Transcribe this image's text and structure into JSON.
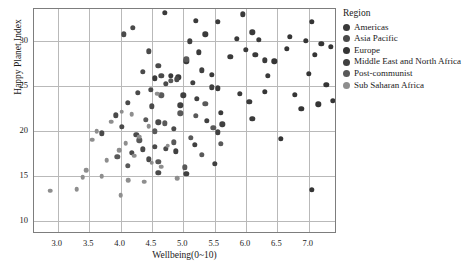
{
  "chart_data": {
    "type": "scatter",
    "title": "",
    "xlabel": "Wellbeing(0~10)",
    "ylabel": "Happy Planet Index",
    "xlim": [
      2.62,
      7.45
    ],
    "ylim": [
      8.6,
      33.6
    ],
    "xticks": [
      "3.0",
      "3.5",
      "4.0",
      "4.5",
      "5.0",
      "5.5",
      "6.0",
      "6.5",
      "7.0"
    ],
    "xtick_values": [
      3.0,
      3.5,
      4.0,
      4.5,
      5.0,
      5.5,
      6.0,
      6.5,
      7.0
    ],
    "yticks": [
      "10",
      "15",
      "20",
      "25",
      "30"
    ],
    "ytick_values": [
      10,
      15,
      20,
      25,
      30
    ],
    "grid": true,
    "legend_position": "right",
    "legend_title": "Region",
    "series": [
      {
        "name": "Americas",
        "color": "#3a3a3a",
        "points": [
          [
            4.7,
            33.2
          ],
          [
            5.2,
            32.3
          ],
          [
            5.95,
            33.0
          ],
          [
            5.55,
            32.2
          ],
          [
            6.1,
            31.0
          ],
          [
            5.35,
            30.8
          ],
          [
            5.85,
            30.3
          ],
          [
            6.2,
            30.2
          ],
          [
            5.25,
            28.8
          ],
          [
            6.0,
            29.1
          ],
          [
            6.15,
            28.5
          ],
          [
            5.75,
            28.3
          ],
          [
            6.3,
            27.9
          ],
          [
            5.05,
            27.8
          ],
          [
            5.45,
            26.3
          ],
          [
            4.8,
            26.2
          ],
          [
            5.55,
            24.8
          ],
          [
            5.9,
            24.2
          ],
          [
            6.05,
            23.3
          ],
          [
            6.35,
            26.2
          ],
          [
            5.6,
            22.1
          ],
          [
            6.1,
            21.4
          ],
          [
            4.55,
            25.9
          ],
          [
            4.92,
            26.0
          ]
        ]
      },
      {
        "name": "Asia Pacific",
        "color": "#4a4a4a",
        "points": [
          [
            4.2,
            31.5
          ],
          [
            4.05,
            30.8
          ],
          [
            4.45,
            28.9
          ],
          [
            4.6,
            27.3
          ],
          [
            4.35,
            26.6
          ],
          [
            4.65,
            26.2
          ],
          [
            4.9,
            25.8
          ],
          [
            4.72,
            25.3
          ],
          [
            4.48,
            24.6
          ],
          [
            4.28,
            24.3
          ],
          [
            4.12,
            23.2
          ],
          [
            4.5,
            22.8
          ],
          [
            3.92,
            21.8
          ],
          [
            4.6,
            21.0
          ],
          [
            4.85,
            20.3
          ],
          [
            4.25,
            19.6
          ],
          [
            4.55,
            18.3
          ],
          [
            4.35,
            18.0
          ],
          [
            4.72,
            18.1
          ],
          [
            4.45,
            16.9
          ],
          [
            4.18,
            17.6
          ],
          [
            3.7,
            19.8
          ],
          [
            4.02,
            20.5
          ],
          [
            4.6,
            15.4
          ]
        ]
      },
      {
        "name": "Europe",
        "color": "#353535",
        "points": [
          [
            7.05,
            32.2
          ],
          [
            6.7,
            30.5
          ],
          [
            6.95,
            30.1
          ],
          [
            7.2,
            29.7
          ],
          [
            6.65,
            29.2
          ],
          [
            7.1,
            28.5
          ],
          [
            7.35,
            29.4
          ],
          [
            7.0,
            26.4
          ],
          [
            7.28,
            25.2
          ],
          [
            6.78,
            24.1
          ],
          [
            7.15,
            23.0
          ],
          [
            6.88,
            22.5
          ],
          [
            7.38,
            23.4
          ],
          [
            6.55,
            19.2
          ],
          [
            7.05,
            13.5
          ],
          [
            6.45,
            27.8
          ],
          [
            6.3,
            24.4
          ]
        ]
      },
      {
        "name": "Middle East and North Africa",
        "color": "#404040",
        "points": [
          [
            5.1,
            30.0
          ],
          [
            5.3,
            26.8
          ],
          [
            5.15,
            25.4
          ],
          [
            5.45,
            24.9
          ],
          [
            5.0,
            24.0
          ],
          [
            5.22,
            23.6
          ],
          [
            4.95,
            22.9
          ],
          [
            5.38,
            21.2
          ],
          [
            5.55,
            19.9
          ],
          [
            5.18,
            18.5
          ],
          [
            4.88,
            17.8
          ],
          [
            5.5,
            16.4
          ],
          [
            5.05,
            15.3
          ],
          [
            5.62,
            20.8
          ]
        ]
      },
      {
        "name": "Post-communist",
        "color": "#595959",
        "points": [
          [
            5.05,
            28.0
          ],
          [
            4.8,
            25.6
          ],
          [
            4.65,
            24.0
          ],
          [
            5.35,
            23.1
          ],
          [
            4.95,
            22.0
          ],
          [
            5.2,
            21.7
          ],
          [
            4.4,
            21.3
          ],
          [
            4.7,
            20.9
          ],
          [
            5.48,
            20.4
          ],
          [
            4.55,
            20.0
          ],
          [
            5.12,
            19.3
          ],
          [
            4.3,
            19.0
          ],
          [
            5.6,
            18.6
          ],
          [
            4.85,
            18.8
          ],
          [
            5.3,
            17.4
          ],
          [
            3.95,
            17.2
          ],
          [
            4.6,
            16.6
          ],
          [
            4.12,
            16.2
          ],
          [
            5.02,
            16.0
          ]
        ]
      },
      {
        "name": "Sub Saharan Africa",
        "color": "#8e8e8e",
        "points": [
          [
            4.58,
            24.2
          ],
          [
            4.02,
            22.2
          ],
          [
            4.18,
            21.9
          ],
          [
            3.85,
            21.1
          ],
          [
            4.45,
            20.6
          ],
          [
            3.62,
            20.0
          ],
          [
            4.3,
            19.4
          ],
          [
            4.08,
            18.7
          ],
          [
            4.75,
            18.4
          ],
          [
            3.55,
            19.1
          ],
          [
            3.98,
            17.9
          ],
          [
            4.22,
            17.3
          ],
          [
            3.78,
            16.8
          ],
          [
            4.5,
            16.5
          ],
          [
            4.65,
            16.1
          ],
          [
            3.45,
            15.7
          ],
          [
            3.7,
            15.0
          ],
          [
            4.12,
            14.6
          ],
          [
            4.38,
            14.4
          ],
          [
            3.3,
            13.6
          ],
          [
            2.88,
            13.4
          ],
          [
            4.0,
            12.9
          ],
          [
            3.4,
            14.9
          ],
          [
            4.9,
            14.8
          ]
        ]
      }
    ]
  },
  "legend": {
    "title": "Region",
    "items": [
      {
        "label": "Americas",
        "color": "#3a3a3a"
      },
      {
        "label": "Asia Pacific",
        "color": "#4a4a4a"
      },
      {
        "label": "Europe",
        "color": "#353535"
      },
      {
        "label": "Middle East and North Africa",
        "color": "#404040"
      },
      {
        "label": "Post-communist",
        "color": "#595959"
      },
      {
        "label": "Sub Saharan Africa",
        "color": "#8e8e8e"
      }
    ]
  }
}
